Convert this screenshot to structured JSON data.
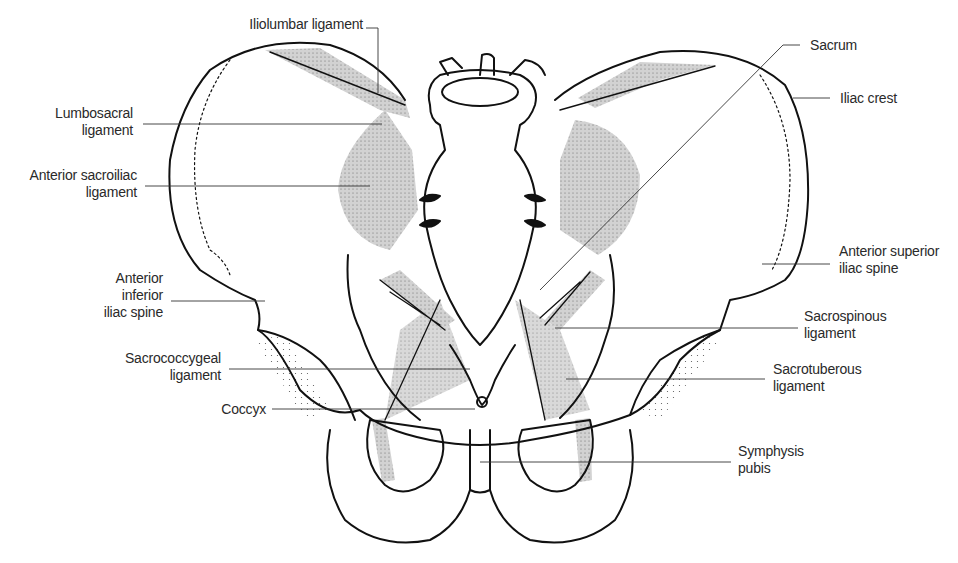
{
  "diagram": {
    "colors": {
      "outline": "#111111",
      "ligament_fill": "#cfcfcf",
      "leader_line": "#333333",
      "text": "#2a2a2a"
    },
    "labels": {
      "iliolumbar": "Iliolumbar ligament",
      "lumbosacral": "Lumbosacral\nligament",
      "anterior_sacroiliac": "Anterior sacroiliac\nligament",
      "anterior_inferior_iliac_spine": "Anterior\ninferior\niliac spine",
      "sacrococcygeal": "Sacrococcygeal\nligament",
      "coccyx": "Coccyx",
      "sacrum": "Sacrum",
      "iliac_crest": "Iliac crest",
      "anterior_superior_iliac_spine": "Anterior superior\niliac spine",
      "sacrospinous": "Sacrospinous\nligament",
      "sacrotuberous": "Sacrotuberous\nligament",
      "symphysis_pubis": "Symphysis\npubis"
    }
  }
}
